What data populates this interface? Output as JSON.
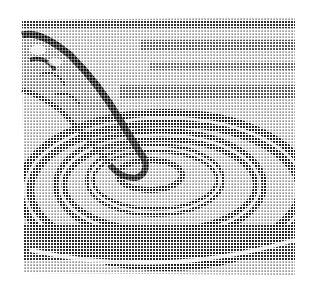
{
  "image": {
    "subject": "finger touching water surface creating concentric ripples",
    "style": "halftone dot illustration, monochrome",
    "ink_color": "#1a1a1a",
    "paper_color": "#ffffff"
  }
}
